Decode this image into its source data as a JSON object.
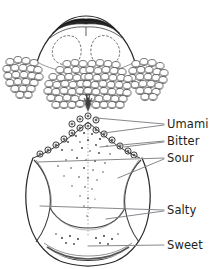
{
  "figure": {
    "background_color": "#ffffff",
    "ink_color": "#231f20",
    "leader_line_color": "#808285",
    "width": 211,
    "height": 269
  },
  "labels": [
    {
      "id": "umami",
      "text": "Umami",
      "x": 167,
      "y": 118
    },
    {
      "id": "bitter",
      "text": "Bitter",
      "x": 167,
      "y": 135
    },
    {
      "id": "sour",
      "text": "Sour",
      "x": 167,
      "y": 152
    },
    {
      "id": "salty",
      "text": "Salty",
      "x": 167,
      "y": 204
    },
    {
      "id": "sweet",
      "text": "Sweet",
      "x": 167,
      "y": 239
    }
  ],
  "leader_lines": [
    {
      "id": "umami-leader-a",
      "from": [
        96,
        118
      ],
      "to": [
        164,
        124
      ]
    },
    {
      "id": "umami-leader-b",
      "from": [
        104,
        133
      ],
      "to": [
        164,
        125
      ]
    },
    {
      "id": "bitter-leader-a",
      "from": [
        100,
        147
      ],
      "to": [
        164,
        141
      ]
    },
    {
      "id": "bitter-leader-b",
      "from": [
        124,
        146
      ],
      "to": [
        164,
        142
      ]
    },
    {
      "id": "sour-leader-a",
      "from": [
        38,
        162
      ],
      "to": [
        164,
        158
      ]
    },
    {
      "id": "sour-leader-b",
      "from": [
        118,
        178
      ],
      "to": [
        164,
        159
      ]
    },
    {
      "id": "salty-leader-a",
      "from": [
        40,
        206
      ],
      "to": [
        164,
        210
      ]
    },
    {
      "id": "salty-leader-b",
      "from": [
        106,
        219
      ],
      "to": [
        164,
        211
      ]
    },
    {
      "id": "sweet-leader",
      "from": [
        88,
        246
      ],
      "to": [
        164,
        245
      ]
    }
  ],
  "anatomy": {
    "epiglottis": {
      "name": "epiglottis",
      "center": [
        86,
        32
      ]
    },
    "lingual_tonsil_left": {
      "name": "lingual-tonsil-left",
      "center": [
        24,
        75
      ]
    },
    "lingual_tonsil_right": {
      "name": "lingual-tonsil-right",
      "center": [
        148,
        75
      ]
    },
    "tongue_root_follicles_left": {
      "name": "lingual-follicles-left",
      "center": [
        68,
        85
      ]
    },
    "tongue_root_follicles_right": {
      "name": "lingual-follicles-right",
      "center": [
        105,
        85
      ]
    },
    "circumvallate_papillae": {
      "name": "circumvallate-papillae",
      "count": 14
    },
    "foramen_cecum": {
      "name": "foramen-cecum",
      "center": [
        88,
        102
      ]
    },
    "tongue_body": {
      "name": "tongue-body"
    },
    "median_sulcus": {
      "name": "median-sulcus"
    },
    "tongue_tip": {
      "name": "tongue-tip",
      "center": [
        86,
        250
      ]
    }
  }
}
